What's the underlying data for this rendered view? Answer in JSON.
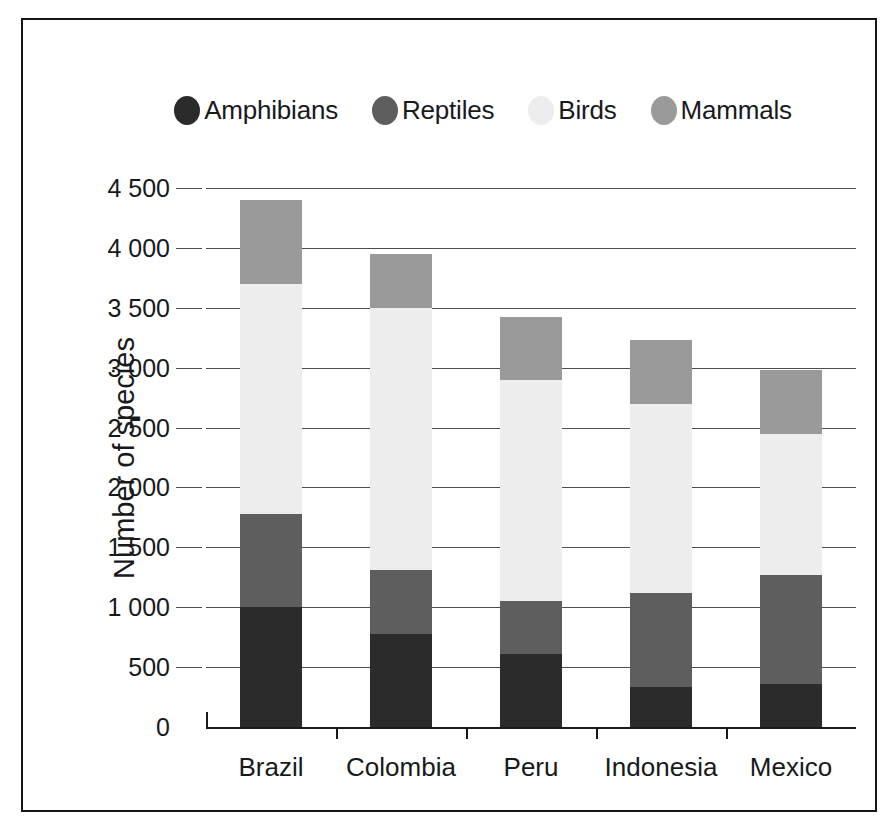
{
  "chart_data": {
    "type": "bar",
    "subtype": "stacked-vertical",
    "title": "",
    "xlabel": "",
    "ylabel": "Number of species",
    "ylim": [
      0,
      4500
    ],
    "ytick_labels": [
      "0",
      "500",
      "1 000",
      "1 500",
      "2 000",
      "2 500",
      "3 000",
      "3 500",
      "4 000",
      "4 500"
    ],
    "ytick_values": [
      0,
      500,
      1000,
      1500,
      2000,
      2500,
      3000,
      3500,
      4000,
      4500
    ],
    "grid": "horizontal",
    "legend_position": "top",
    "categories": [
      "Brazil",
      "Colombia",
      "Peru",
      "Indonesia",
      "Mexico"
    ],
    "series": [
      {
        "name": "Amphibians",
        "color": "#2b2b2b",
        "values": [
          1000,
          780,
          610,
          330,
          360
        ]
      },
      {
        "name": "Reptiles",
        "color": "#5e5e5e",
        "values": [
          780,
          530,
          440,
          790,
          910
        ]
      },
      {
        "name": "Birds",
        "color": "#ededed",
        "values": [
          1920,
          2190,
          1850,
          1580,
          1180
        ]
      },
      {
        "name": "Mammals",
        "color": "#9a9a9a",
        "values": [
          700,
          450,
          520,
          530,
          530
        ]
      }
    ],
    "totals": [
      4400,
      3950,
      3420,
      3230,
      2980
    ]
  },
  "legend": {
    "items": [
      {
        "label": "Amphibians",
        "color": "#2b2b2b"
      },
      {
        "label": "Reptiles",
        "color": "#5e5e5e"
      },
      {
        "label": "Birds",
        "color": "#ededed"
      },
      {
        "label": "Mammals",
        "color": "#9a9a9a"
      }
    ]
  },
  "colors": {
    "frame": "#15181a",
    "axis": "#17191b",
    "gridline": "#4a4d50",
    "background": "#ffffff"
  }
}
